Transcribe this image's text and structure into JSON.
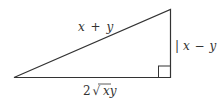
{
  "diagram": {
    "type": "right-triangle",
    "colors": {
      "stroke": "#333333",
      "text": "#333333",
      "background": "#ffffff"
    },
    "labels": {
      "hypotenuse": {
        "x": "x",
        "op": "+",
        "y": "y"
      },
      "vertical_leg": {
        "bar_left": "|",
        "x": "x",
        "op": "−",
        "y": "y",
        "bar_right": "|"
      },
      "horizontal_leg": {
        "coef": "2",
        "radical": "√",
        "radicand": "xy"
      }
    },
    "right_angle_marker": true
  }
}
